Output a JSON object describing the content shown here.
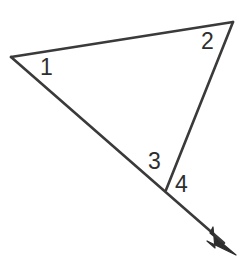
{
  "figure": {
    "kind": "geometry-angle-diagram",
    "width": 250,
    "height": 268,
    "background_color": "#ffffff",
    "stroke_color": "#3a3a3a",
    "stroke_width": 2.6,
    "label_color": "#2e2e2e"
  },
  "points": {
    "left_vertex": {
      "name": "A",
      "x": 11,
      "y": 57
    },
    "apex_vertex": {
      "name": "B",
      "x": 233,
      "y": 22
    },
    "bottom_vertex": {
      "name": "C",
      "x": 166,
      "y": 190
    },
    "arrow_tip": {
      "name": "D",
      "x": 236,
      "y": 255
    }
  },
  "segments": [
    {
      "id": "top-edge",
      "name": "segment-A-B",
      "from": "left_vertex",
      "to": "apex_vertex",
      "d": "M 11 57 L 233 22"
    },
    {
      "id": "right-edge",
      "name": "segment-B-C",
      "from": "apex_vertex",
      "to": "bottom_vertex",
      "d": "M 233 22 L 166 190"
    },
    {
      "id": "extended-ray",
      "name": "ray-A-C-D",
      "from": "left_vertex",
      "to": "arrow_tip",
      "d": "M 11 57 L 224 243"
    }
  ],
  "arrowhead": {
    "name": "arrowhead",
    "points": "236,255 210,233 213,227 215,248 207,241",
    "simple_points": "236,255 209,230 214,250"
  },
  "labels": [
    {
      "id": "1",
      "name": "angle-label-1",
      "text": "1",
      "at_vertex": "left_vertex",
      "x": 40,
      "y": 56
    },
    {
      "id": "2",
      "name": "angle-label-2",
      "text": "2",
      "at_vertex": "apex_vertex",
      "x": 201,
      "y": 30
    },
    {
      "id": "3",
      "name": "angle-label-3",
      "text": "3",
      "at_vertex": "bottom_vertex",
      "x": 148,
      "y": 150
    },
    {
      "id": "4",
      "name": "angle-label-4",
      "text": "4",
      "at_vertex": "bottom_vertex",
      "x": 175,
      "y": 173
    }
  ]
}
